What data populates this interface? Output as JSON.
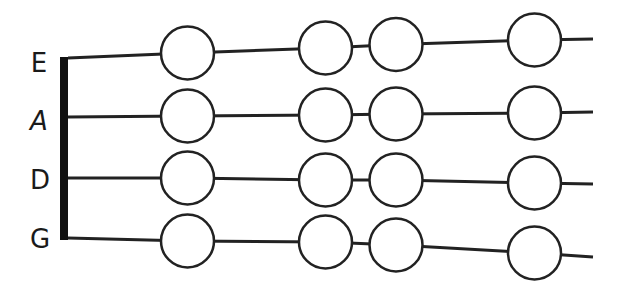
{
  "diagram": {
    "colors": {
      "background": "#ffffff",
      "stroke": "#222222",
      "nut": "#111111",
      "circle_fill": "#ffffff"
    },
    "nut": {
      "x": 60,
      "y_top": 57,
      "y_bottom": 240,
      "width": 8
    },
    "circle_radius": 26.5,
    "string_end_x": 593,
    "strings": [
      {
        "name": "E",
        "label_x": 27,
        "label_y": 50,
        "italic": false,
        "start": [
          68,
          58
        ],
        "circles": [
          [
            187.5,
            53
          ],
          [
            325.5,
            48
          ],
          [
            396,
            44.5
          ],
          [
            534.5,
            40
          ]
        ],
        "end": [
          593,
          39
        ]
      },
      {
        "name": "A",
        "label_x": 27,
        "label_y": 108,
        "italic": true,
        "start": [
          68,
          117
        ],
        "circles": [
          [
            187.5,
            116
          ],
          [
            325.5,
            115
          ],
          [
            396,
            114
          ],
          [
            534.5,
            113
          ]
        ],
        "end": [
          593,
          112
        ]
      },
      {
        "name": "D",
        "label_x": 28,
        "label_y": 167,
        "italic": false,
        "start": [
          68,
          178
        ],
        "circles": [
          [
            187.5,
            178
          ],
          [
            325.5,
            180
          ],
          [
            396,
            180
          ],
          [
            534.5,
            183
          ]
        ],
        "end": [
          593,
          184
        ]
      },
      {
        "name": "G",
        "label_x": 28,
        "label_y": 226,
        "italic": false,
        "start": [
          68,
          238
        ],
        "circles": [
          [
            187.5,
            241
          ],
          [
            325.5,
            242
          ],
          [
            396,
            245
          ],
          [
            534.5,
            253
          ]
        ],
        "end": [
          593,
          257
        ]
      }
    ]
  }
}
